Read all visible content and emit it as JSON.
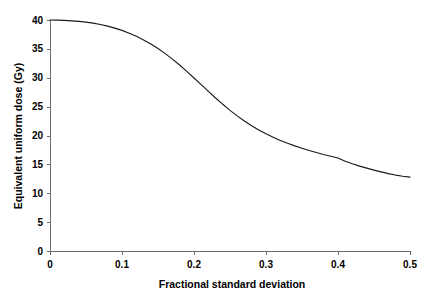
{
  "chart_data": {
    "type": "line",
    "title": "",
    "xlabel": "Fractional standard deviation",
    "ylabel": "Equivalent uniform dose (Gy)",
    "xlim": [
      0,
      0.5
    ],
    "ylim": [
      0,
      40
    ],
    "grid": false,
    "legend": null,
    "xticks": [
      "0",
      "0.1",
      "0.2",
      "0.3",
      "0.4",
      "0.5"
    ],
    "xtick_values": [
      0,
      0.1,
      0.2,
      0.3,
      0.4,
      0.5
    ],
    "yticks": [
      "0",
      "5",
      "10",
      "15",
      "20",
      "25",
      "30",
      "35",
      "40"
    ],
    "ytick_values": [
      0,
      5,
      10,
      15,
      20,
      25,
      30,
      35,
      40
    ],
    "series": [
      {
        "name": "Equivalent uniform dose",
        "color": "#1a1a1a",
        "x": [
          0.0,
          0.01,
          0.02,
          0.03,
          0.04,
          0.05,
          0.06,
          0.07,
          0.08,
          0.09,
          0.1,
          0.11,
          0.12,
          0.13,
          0.14,
          0.15,
          0.16,
          0.17,
          0.18,
          0.19,
          0.2,
          0.21,
          0.22,
          0.23,
          0.24,
          0.25,
          0.26,
          0.27,
          0.28,
          0.29,
          0.3,
          0.31,
          0.32,
          0.33,
          0.34,
          0.35,
          0.36,
          0.37,
          0.38,
          0.39,
          0.4,
          0.41,
          0.42,
          0.43,
          0.44,
          0.45,
          0.46,
          0.47,
          0.48,
          0.49,
          0.5
        ],
        "y": [
          40.0,
          39.98,
          39.93,
          39.86,
          39.76,
          39.63,
          39.45,
          39.22,
          38.93,
          38.6,
          38.2,
          37.72,
          37.18,
          36.55,
          35.85,
          35.05,
          34.18,
          33.22,
          32.2,
          31.1,
          29.95,
          28.8,
          27.65,
          26.5,
          25.4,
          24.35,
          23.4,
          22.5,
          21.7,
          20.95,
          20.3,
          19.7,
          19.15,
          18.65,
          18.2,
          17.8,
          17.4,
          17.05,
          16.7,
          16.4,
          16.1,
          15.55,
          15.1,
          14.7,
          14.35,
          14.0,
          13.7,
          13.4,
          13.15,
          12.95,
          12.8
        ]
      }
    ],
    "annotations": []
  },
  "axes": {
    "x_title": "Fractional standard deviation",
    "y_title": "Equivalent uniform dose (Gy)"
  }
}
